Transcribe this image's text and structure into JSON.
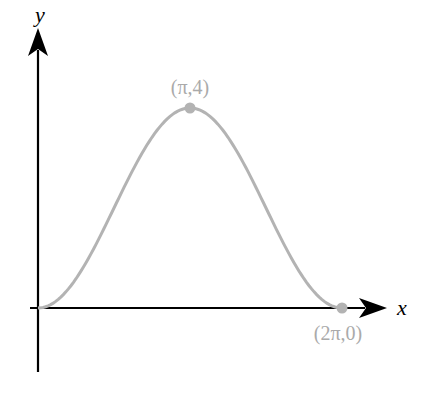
{
  "chart_data": {
    "type": "line",
    "title": "",
    "xlabel": "x",
    "ylabel": "y",
    "function": "y = 2 - 2cos(x)",
    "x": [
      0,
      0.7854,
      1.5708,
      2.3562,
      3.1416,
      3.927,
      4.7124,
      5.4978,
      6.2832
    ],
    "values": [
      0,
      0.586,
      2,
      3.414,
      4,
      3.414,
      2,
      0.586,
      0
    ],
    "xlim": [
      0,
      6.2832
    ],
    "ylim": [
      0,
      4
    ],
    "grid": false,
    "annotations": [
      {
        "label": "(π,4)",
        "x": 3.1416,
        "y": 4
      },
      {
        "label": "(2π,0)",
        "x": 6.2832,
        "y": 0
      }
    ],
    "colors": {
      "curve": "#b3b3b3",
      "axes": "#000000",
      "labels": "#aaaaaa"
    }
  },
  "axes": {
    "x_label": "x",
    "y_label": "y"
  },
  "points": {
    "peak_label": "(π,4)",
    "end_label": "(2π,0)"
  }
}
